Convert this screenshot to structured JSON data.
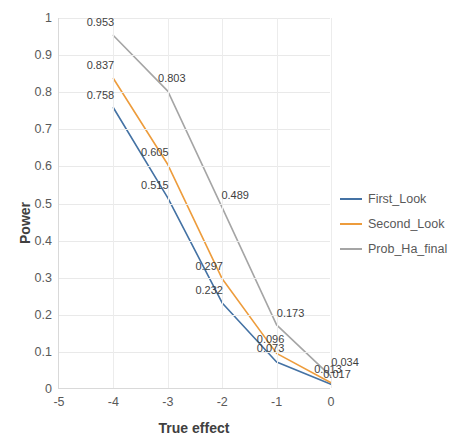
{
  "chart_data": {
    "type": "line",
    "title": "",
    "xlabel": "True effect",
    "ylabel": "Power",
    "x": [
      -5,
      -4,
      -3,
      -2,
      -1,
      0
    ],
    "xlim": [
      -5,
      0
    ],
    "ylim": [
      0,
      1
    ],
    "xticks": [
      "-5",
      "-4",
      "-3",
      "-2",
      "-1",
      "0"
    ],
    "yticks": [
      "0",
      "0.1",
      "0.2",
      "0.3",
      "0.4",
      "0.5",
      "0.6",
      "0.7",
      "0.8",
      "0.9",
      "1"
    ],
    "grid": true,
    "legend_position": "right",
    "series": [
      {
        "name": "First_Look",
        "color": "#4472a4",
        "x": [
          -4,
          -3,
          -2,
          -1,
          0
        ],
        "values": [
          0.758,
          0.515,
          0.232,
          0.073,
          0.013
        ],
        "labels": [
          "0.758",
          "0.515",
          "0.232",
          "0.073",
          "0.013"
        ]
      },
      {
        "name": "Second_Look",
        "color": "#ed9c3c",
        "x": [
          -4,
          -3,
          -2,
          -1,
          0
        ],
        "values": [
          0.837,
          0.605,
          0.297,
          0.096,
          0.017
        ],
        "labels": [
          "0.837",
          "0.605",
          "0.297",
          "0.096",
          "0.017"
        ]
      },
      {
        "name": "Prob_Ha_final",
        "color": "#a5a5a5",
        "x": [
          -4,
          -3,
          -2,
          -1,
          0
        ],
        "values": [
          0.953,
          0.803,
          0.489,
          0.173,
          0.034
        ],
        "labels": [
          "0.953",
          "0.803",
          "0.489",
          "0.173",
          "0.034"
        ]
      }
    ],
    "label_offsets": [
      [
        -13,
        -13
      ],
      [
        -13,
        -13
      ],
      [
        -13,
        -13
      ],
      [
        -6,
        -14
      ],
      [
        -3,
        -15
      ],
      [
        -13,
        -13
      ],
      [
        -13,
        -13
      ],
      [
        -13,
        -13
      ],
      [
        -6,
        -14
      ],
      [
        6,
        -9
      ],
      [
        -13,
        -13
      ],
      [
        4,
        -13
      ],
      [
        13,
        -13
      ],
      [
        14,
        -12
      ],
      [
        14,
        -14
      ]
    ]
  },
  "legend": {
    "items": [
      {
        "label": "First_Look",
        "color": "#4472a4"
      },
      {
        "label": "Second_Look",
        "color": "#ed9c3c"
      },
      {
        "label": "Prob_Ha_final",
        "color": "#a5a5a5"
      }
    ]
  }
}
